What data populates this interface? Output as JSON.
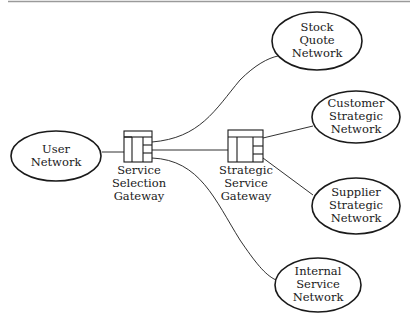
{
  "diagram": {
    "colors": {
      "stroke": "#1a1a1a",
      "rule": "#9a9a9a",
      "background": "#ffffff"
    },
    "networks": [
      {
        "id": "user",
        "lines": [
          "User",
          "Network"
        ]
      },
      {
        "id": "stock",
        "lines": [
          "Stock",
          "Quote",
          "Network"
        ]
      },
      {
        "id": "customer",
        "lines": [
          "Customer",
          "Strategic",
          "Network"
        ]
      },
      {
        "id": "supplier",
        "lines": [
          "Supplier",
          "Strategic",
          "Network"
        ]
      },
      {
        "id": "internal",
        "lines": [
          "Internal",
          "Service",
          "Network"
        ]
      }
    ],
    "gateways": [
      {
        "id": "ssg",
        "lines": [
          "Service",
          "Selection",
          "Gateway"
        ]
      },
      {
        "id": "strategic",
        "lines": [
          "Strategic",
          "Service",
          "Gateway"
        ]
      }
    ],
    "connections": [
      {
        "from": "User Network",
        "to": "Service Selection Gateway"
      },
      {
        "from": "Service Selection Gateway",
        "to": "Stock Quote Network"
      },
      {
        "from": "Service Selection Gateway",
        "to": "Strategic Service Gateway"
      },
      {
        "from": "Service Selection Gateway",
        "to": "Internal Service Network"
      },
      {
        "from": "Strategic Service Gateway",
        "to": "Customer Strategic Network"
      },
      {
        "from": "Strategic Service Gateway",
        "to": "Supplier Strategic Network"
      }
    ]
  }
}
